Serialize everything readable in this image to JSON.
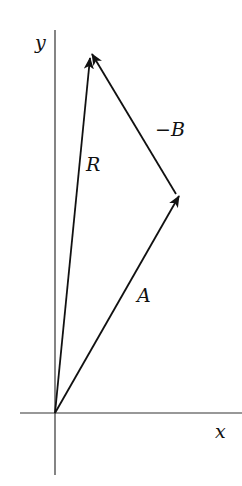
{
  "diagram": {
    "type": "vector-addition",
    "axes": {
      "x_label": "x",
      "y_label": "y",
      "origin": [
        55,
        413
      ]
    },
    "vectors": [
      {
        "id": "A",
        "label": "A",
        "from": [
          55,
          413
        ],
        "to": [
          179,
          196
        ]
      },
      {
        "id": "minus-B",
        "label": "−B",
        "from": [
          176,
          194
        ],
        "to": [
          92,
          54
        ]
      },
      {
        "id": "R",
        "label": "R",
        "from": [
          55,
          413
        ],
        "to": [
          90,
          58
        ]
      }
    ],
    "colors": {
      "line": "#111111",
      "axis": "#333333",
      "background": "#ffffff"
    }
  }
}
